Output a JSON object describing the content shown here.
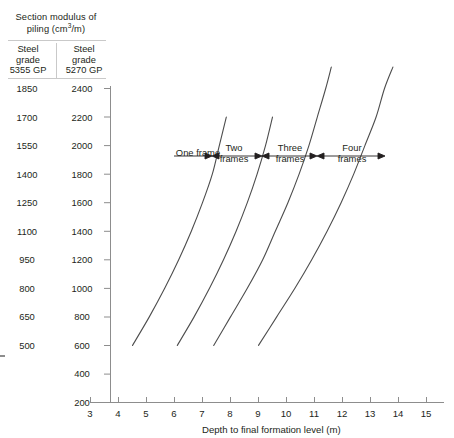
{
  "legend": {
    "title_line1": "Section modulus of",
    "title_line2_pre": "piling (cm",
    "title_sup": "3",
    "title_line2_post": "/m)",
    "columns": [
      {
        "head_line1": "Steel",
        "head_line2": "grade",
        "head_line3": "5355 GP"
      },
      {
        "head_line1": "Steel",
        "head_line2": "grade",
        "head_line3": "5270 GP"
      }
    ]
  },
  "chart_data": {
    "type": "line",
    "title": "Section modulus of piling (cm3/m)",
    "xlabel": "Depth to final formation level (m)",
    "ylabel": "Section modulus of piling (cm3/m)",
    "xlim": [
      3,
      15
    ],
    "ylim": [
      200,
      2400
    ],
    "grid": false,
    "legend_position": "none",
    "xticks": [
      3,
      4,
      5,
      6,
      7,
      8,
      9,
      10,
      11,
      12,
      13,
      14,
      15
    ],
    "yticks_grade_5270": [
      200,
      400,
      600,
      800,
      1000,
      1200,
      1400,
      1600,
      1800,
      2000,
      2200,
      2400
    ],
    "yticks_grade_5355": [
      500,
      650,
      800,
      950,
      1100,
      1250,
      1400,
      1550,
      1700,
      1850
    ],
    "ytick_5355_starts_at": 600,
    "series": [
      {
        "name": "One frame",
        "points": [
          {
            "x": 4.5,
            "y": 600
          },
          {
            "x": 5.1,
            "y": 800
          },
          {
            "x": 5.65,
            "y": 1000
          },
          {
            "x": 6.15,
            "y": 1200
          },
          {
            "x": 6.6,
            "y": 1400
          },
          {
            "x": 7.0,
            "y": 1600
          },
          {
            "x": 7.35,
            "y": 1800
          },
          {
            "x": 7.6,
            "y": 2000
          },
          {
            "x": 7.85,
            "y": 2200
          }
        ]
      },
      {
        "name": "Two frames",
        "points": [
          {
            "x": 6.1,
            "y": 600
          },
          {
            "x": 6.7,
            "y": 800
          },
          {
            "x": 7.25,
            "y": 1000
          },
          {
            "x": 7.75,
            "y": 1200
          },
          {
            "x": 8.2,
            "y": 1400
          },
          {
            "x": 8.6,
            "y": 1600
          },
          {
            "x": 8.95,
            "y": 1800
          },
          {
            "x": 9.25,
            "y": 2000
          },
          {
            "x": 9.5,
            "y": 2200
          }
        ]
      },
      {
        "name": "Three frames",
        "points": [
          {
            "x": 7.4,
            "y": 600
          },
          {
            "x": 8.0,
            "y": 800
          },
          {
            "x": 8.6,
            "y": 1000
          },
          {
            "x": 9.15,
            "y": 1200
          },
          {
            "x": 9.6,
            "y": 1400
          },
          {
            "x": 10.05,
            "y": 1600
          },
          {
            "x": 10.45,
            "y": 1800
          },
          {
            "x": 10.8,
            "y": 2000
          },
          {
            "x": 11.1,
            "y": 2200
          },
          {
            "x": 11.4,
            "y": 2400
          },
          {
            "x": 11.6,
            "y": 2550
          }
        ]
      },
      {
        "name": "Four frames",
        "points": [
          {
            "x": 9.0,
            "y": 600
          },
          {
            "x": 9.65,
            "y": 800
          },
          {
            "x": 10.3,
            "y": 1000
          },
          {
            "x": 10.9,
            "y": 1200
          },
          {
            "x": 11.45,
            "y": 1400
          },
          {
            "x": 11.95,
            "y": 1600
          },
          {
            "x": 12.4,
            "y": 1800
          },
          {
            "x": 12.8,
            "y": 2000
          },
          {
            "x": 13.2,
            "y": 2200
          },
          {
            "x": 13.5,
            "y": 2400
          },
          {
            "x": 13.8,
            "y": 2550
          }
        ]
      }
    ],
    "annotations": [
      {
        "label_line1": "One frame",
        "label_line2": ""
      },
      {
        "label_line1": "Two",
        "label_line2": "frames"
      },
      {
        "label_line1": "Three",
        "label_line2": "frames"
      },
      {
        "label_line1": "Four",
        "label_line2": "frames"
      }
    ]
  },
  "axis": {
    "x_title": "Depth to final formation level (m)",
    "xticks": [
      "3",
      "4",
      "5",
      "6",
      "7",
      "8",
      "9",
      "10",
      "11",
      "12",
      "13",
      "14",
      "15"
    ],
    "y_col_5355": [
      "1850",
      "1700",
      "1550",
      "1400",
      "1250",
      "1100",
      "950",
      "800",
      "650",
      "500"
    ],
    "y_col_5270": [
      "2400",
      "2200",
      "2000",
      "1800",
      "1600",
      "1400",
      "1200",
      "1000",
      "800",
      "600",
      "400",
      "200"
    ]
  },
  "colors": {
    "curve": "#4d4d4d",
    "axis": "#8d8d8d",
    "text": "#231f20",
    "rule": "#c9c9c9"
  }
}
